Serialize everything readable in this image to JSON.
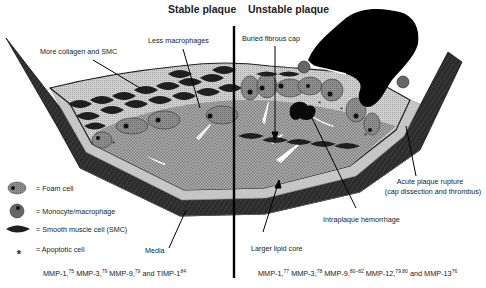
{
  "diagram": {
    "titles": {
      "stable": "Stable plaque",
      "unstable": "Unstable plaque"
    },
    "annotations": {
      "more_collagen": "More collagen and SMC",
      "less_macrophages": "Less macrophages",
      "buried_cap": "Buried fibrous cap",
      "acute_rupture_1": "Acute plaque rupture",
      "acute_rupture_2": "(cap dissection and thrombus)",
      "intraplaque_hemorrhage": "Intraplaque hemorrhage",
      "larger_lipid_core": "Larger lipid core",
      "media": "Media"
    },
    "legend": [
      {
        "icon": "foam-cell-icon",
        "label": "= Foam cell"
      },
      {
        "icon": "monocyte-macrophage-icon",
        "label": "= Monocyte/macrophage"
      },
      {
        "icon": "smooth-muscle-cell-icon",
        "label": "= Smooth muscle cell (SMC)"
      },
      {
        "icon": "apoptotic-cell-icon",
        "label": "= Apoptotic cell",
        "glyph": "*"
      }
    ],
    "references": {
      "stable": [
        {
          "text": "MMP-1,",
          "sup": "75"
        },
        {
          "text": " MMP-3,",
          "sup": "79"
        },
        {
          "text": " MMP-9,",
          "sup": "79"
        },
        {
          "text": " and TIMP-1",
          "sup": "84"
        }
      ],
      "unstable": [
        {
          "text": "MMP-1,",
          "sup": "77"
        },
        {
          "text": " MMP-3,",
          "sup": "78"
        },
        {
          "text": " MMP-9,",
          "sup": "80–82"
        },
        {
          "text": " MMP-12,",
          "sup": "79,80"
        },
        {
          "text": " and MMP-13",
          "sup": "76"
        }
      ]
    },
    "colors": {
      "wall_dark": "#2e2e2e",
      "wall_mid": "#4a4a4a",
      "intima_light": "#c8c8c8",
      "lipid_core": "#9a9a9a",
      "foam_cell": "#8a8a8a",
      "cell_dark": "#1a1a1a",
      "thrombus": "#000000"
    }
  }
}
